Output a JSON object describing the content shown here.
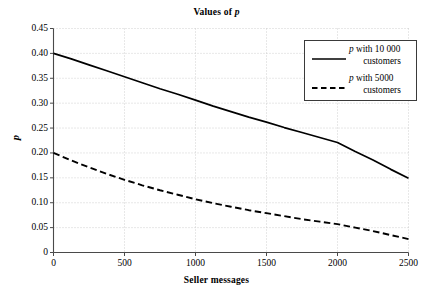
{
  "chart_data": {
    "type": "line",
    "title": "Values of p",
    "title_italic_token": "p",
    "xlabel": "Seller messages",
    "ylabel": "p",
    "xlim": [
      0,
      2500
    ],
    "ylim": [
      0,
      0.45
    ],
    "grid": true,
    "grid_style": "dotted",
    "legend_position": "top-right",
    "xticks": [
      0,
      500,
      1000,
      1500,
      2000,
      2500
    ],
    "xtick_labels": [
      "0",
      "500",
      "1000",
      "1500",
      "2000",
      "2500"
    ],
    "yticks": [
      0,
      0.05,
      0.1,
      0.15,
      0.2,
      0.25,
      0.3,
      0.35,
      0.4,
      0.45
    ],
    "ytick_labels": [
      "0",
      "0.05",
      "0.10",
      "0.15",
      "0.20",
      "0.25",
      "0.30",
      "0.35",
      "0.40",
      "0.45"
    ],
    "x": [
      0,
      125,
      250,
      375,
      500,
      625,
      750,
      875,
      1000,
      1125,
      1250,
      1375,
      1500,
      1625,
      1750,
      1875,
      2000,
      2125,
      2250,
      2375,
      2500
    ],
    "series": [
      {
        "name": "p with 10 000 customers",
        "label_prefix": "p",
        "label_rest": " with 10 000 customers",
        "style": "solid",
        "color": "#000000",
        "values": [
          0.4,
          0.389,
          0.377,
          0.365,
          0.353,
          0.341,
          0.329,
          0.318,
          0.306,
          0.294,
          0.283,
          0.272,
          0.262,
          0.251,
          0.241,
          0.231,
          0.221,
          0.203,
          0.186,
          0.167,
          0.149
        ]
      },
      {
        "name": "p with 5000 customers",
        "label_prefix": "p",
        "label_rest": " with 5000 customers",
        "style": "dashed",
        "color": "#000000",
        "values": [
          0.2,
          0.185,
          0.171,
          0.158,
          0.146,
          0.135,
          0.125,
          0.116,
          0.107,
          0.099,
          0.092,
          0.085,
          0.079,
          0.073,
          0.067,
          0.062,
          0.057,
          0.05,
          0.043,
          0.035,
          0.027
        ]
      }
    ]
  },
  "legend": {
    "items": [
      {
        "line1_prefix": "p",
        "line1_rest": " with 10 000",
        "line2": "customers",
        "style": "solid"
      },
      {
        "line1_prefix": "p",
        "line1_rest": " with 5000",
        "line2": "customers",
        "style": "dashed"
      }
    ]
  },
  "axes": {
    "title_prefix": "Values of ",
    "title_italic": "p",
    "xlabel": "Seller messages",
    "ylabel": "p"
  }
}
